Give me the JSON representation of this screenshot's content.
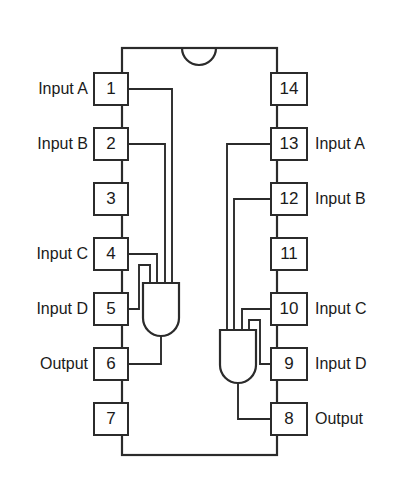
{
  "diagram": {
    "type": "ic-pinout",
    "package": "DIP-14",
    "pin_count": 14,
    "background_color": "#ffffff",
    "line_color": "#2b2b2b",
    "text_color": "#1a1a1a",
    "notch": "top-center-semicircle"
  },
  "pins": [
    {
      "number": "1",
      "side": "left",
      "label": "Input A",
      "index": 0
    },
    {
      "number": "2",
      "side": "left",
      "label": "Input B",
      "index": 1
    },
    {
      "number": "3",
      "side": "left",
      "label": "",
      "index": 2
    },
    {
      "number": "4",
      "side": "left",
      "label": "Input C",
      "index": 3
    },
    {
      "number": "5",
      "side": "left",
      "label": "Input D",
      "index": 4
    },
    {
      "number": "6",
      "side": "left",
      "label": "Output",
      "index": 5
    },
    {
      "number": "7",
      "side": "left",
      "label": "",
      "index": 6
    },
    {
      "number": "8",
      "side": "right",
      "label": "Output",
      "index": 6
    },
    {
      "number": "9",
      "side": "right",
      "label": "Input D",
      "index": 5
    },
    {
      "number": "10",
      "side": "right",
      "label": "Input C",
      "index": 4
    },
    {
      "number": "11",
      "side": "right",
      "label": "",
      "index": 3
    },
    {
      "number": "12",
      "side": "right",
      "label": "Input B",
      "index": 2
    },
    {
      "number": "13",
      "side": "right",
      "label": "Input A",
      "index": 1
    },
    {
      "number": "14",
      "side": "right",
      "label": "",
      "index": 0
    }
  ],
  "left_pin_numbers": {
    "p1": "1",
    "p2": "2",
    "p3": "3",
    "p4": "4",
    "p5": "5",
    "p6": "6",
    "p7": "7"
  },
  "right_pin_numbers": {
    "p14": "14",
    "p13": "13",
    "p12": "12",
    "p11": "11",
    "p10": "10",
    "p9": "9",
    "p8": "8"
  },
  "left_labels": {
    "l1": "Input A",
    "l2": "Input B",
    "l4": "Input C",
    "l5": "Input D",
    "l6": "Output"
  },
  "right_labels": {
    "r13": "Input A",
    "r12": "Input B",
    "r10": "Input C",
    "r9": "Input D",
    "r8": "Output"
  },
  "gates": [
    {
      "name": "gate-1",
      "type": "AND",
      "inputs": [
        "1",
        "2",
        "4",
        "5"
      ],
      "output": "6"
    },
    {
      "name": "gate-2",
      "type": "AND",
      "inputs": [
        "13",
        "12",
        "10",
        "9"
      ],
      "output": "8"
    }
  ]
}
